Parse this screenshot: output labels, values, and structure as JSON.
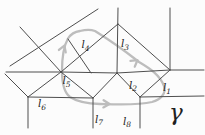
{
  "figure": {
    "width": 205,
    "height": 135,
    "background": "#fcfcfc",
    "line_color": "#4e4e4e",
    "line_width": 1,
    "label_color": "#1f1f1f",
    "label_font_size": 10.5,
    "sub_font_size": 7.5,
    "gamma_color": "#bdbdbd",
    "gamma_width": 2.3,
    "segments": [
      [
        6,
        72,
        61,
        72
      ],
      [
        61,
        72,
        117,
        73
      ],
      [
        117,
        73,
        170,
        70
      ],
      [
        170,
        70,
        204,
        70
      ],
      [
        10,
        66,
        98,
        9
      ],
      [
        20,
        27,
        61,
        72
      ],
      [
        118,
        24,
        61,
        72
      ],
      [
        61,
        72,
        28,
        97
      ],
      [
        118,
        8,
        117,
        73
      ],
      [
        118,
        24,
        170,
        70
      ],
      [
        170,
        8,
        170,
        70
      ],
      [
        61,
        72,
        93,
        98
      ],
      [
        68,
        39,
        91,
        73
      ],
      [
        117,
        73,
        93,
        98
      ],
      [
        117,
        73,
        140,
        97
      ],
      [
        140,
        97,
        170,
        70
      ],
      [
        140,
        97,
        204,
        96
      ],
      [
        140,
        97,
        140,
        128
      ],
      [
        93,
        98,
        93,
        128
      ],
      [
        28,
        97,
        93,
        98
      ],
      [
        28,
        97,
        28,
        128
      ],
      [
        5,
        74,
        28,
        97
      ]
    ],
    "gamma_loop": {
      "path": "M 80,31 C 86,29.5 91,29.5 95,31 C 112,41.5 127,52.5 139,62 C 150,68.5 160,75 164,86 C 166.5,93 161,99.5 152,102 C 138,105.5 118,104.5 100,104 C 88,103.6 76,101 70,97 C 64,92.5 62,82 62,71 C 62,58 64,45.5 68,38.5 C 71,33.8 75,31.7 80,31 Z",
      "arrows": [
        {
          "x": 64.2,
          "y": 46,
          "angle": -70
        },
        {
          "x": 137,
          "y": 60.5,
          "angle": -37
        },
        {
          "x": 109,
          "y": 104,
          "angle": 2
        }
      ]
    },
    "labels": [
      {
        "id": "l4",
        "base": "l",
        "sub": "4",
        "x": 81.5,
        "y": 48
      },
      {
        "id": "l3",
        "base": "l",
        "sub": "3",
        "x": 121,
        "y": 47
      },
      {
        "id": "l5",
        "base": "l",
        "sub": "5",
        "x": 62.5,
        "y": 84
      },
      {
        "id": "l2",
        "base": "l",
        "sub": "2",
        "x": 129,
        "y": 88.5
      },
      {
        "id": "l1",
        "base": "l",
        "sub": "1",
        "x": 163,
        "y": 91
      },
      {
        "id": "l6",
        "base": "l",
        "sub": "6",
        "x": 38,
        "y": 107
      },
      {
        "id": "l7",
        "base": "l",
        "sub": "7",
        "x": 95,
        "y": 122.5
      },
      {
        "id": "l8",
        "base": "l",
        "sub": "8",
        "x": 123,
        "y": 124.5
      }
    ],
    "gamma_label": {
      "text": "γ",
      "x": 169,
      "y": 120,
      "size": 23
    }
  }
}
